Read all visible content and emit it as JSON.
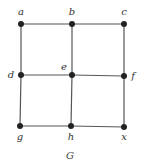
{
  "graph": {
    "caption": "G",
    "nodes": [
      {
        "id": "a",
        "label": "a",
        "x": 21,
        "y": 24,
        "lx": 21,
        "ly": 15
      },
      {
        "id": "b",
        "label": "b",
        "x": 72,
        "y": 24,
        "lx": 72,
        "ly": 15
      },
      {
        "id": "c",
        "label": "c",
        "x": 124,
        "y": 24,
        "lx": 124,
        "ly": 15
      },
      {
        "id": "d",
        "label": "d",
        "x": 21,
        "y": 75,
        "lx": 11,
        "ly": 78
      },
      {
        "id": "e",
        "label": "e",
        "x": 72,
        "y": 75,
        "lx": 64,
        "ly": 70
      },
      {
        "id": "f",
        "label": "f",
        "x": 124,
        "y": 76,
        "lx": 133,
        "ly": 79
      },
      {
        "id": "g",
        "label": "g",
        "x": 20,
        "y": 126,
        "lx": 20,
        "ly": 140
      },
      {
        "id": "h",
        "label": "h",
        "x": 71,
        "y": 126,
        "lx": 71,
        "ly": 140
      },
      {
        "id": "x",
        "label": "x",
        "x": 124,
        "y": 127,
        "lx": 124,
        "ly": 140
      }
    ],
    "edges": [
      [
        "a",
        "b"
      ],
      [
        "b",
        "c"
      ],
      [
        "d",
        "e"
      ],
      [
        "e",
        "f"
      ],
      [
        "g",
        "h"
      ],
      [
        "h",
        "x"
      ],
      [
        "a",
        "d"
      ],
      [
        "d",
        "g"
      ],
      [
        "b",
        "e"
      ],
      [
        "e",
        "h"
      ],
      [
        "c",
        "f"
      ],
      [
        "f",
        "x"
      ]
    ],
    "colors": {
      "edge": "#555555",
      "node": "#222222",
      "label": "#333333"
    }
  }
}
